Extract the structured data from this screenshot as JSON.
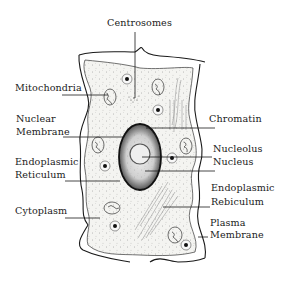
{
  "diagram": {
    "labels": {
      "centrosomes": "Centrosomes",
      "mitochondria": "Mitochondria",
      "nuclear_membrane_1": "Nuclear",
      "nuclear_membrane_2": "Membrane",
      "endoplasmic_reticulum_left_1": "Endoplasmic",
      "endoplasmic_reticulum_left_2": "Reticulum",
      "cytoplasm": "Cytoplasm",
      "chromatin": "Chromatin",
      "nucleolus": "Nucleolus",
      "nucleus": "Nucleus",
      "endoplasmic_reticulum_right_1": "Endoplasmic",
      "endoplasmic_reticulum_right_2": "Rebiculum",
      "plasma_membrane_1": "Plasma",
      "plasma_membrane_2": "Membrane"
    },
    "colors": {
      "line": "#1a1a1a",
      "cell_fill": "#f4f4f1",
      "background": "#ffffff"
    }
  }
}
